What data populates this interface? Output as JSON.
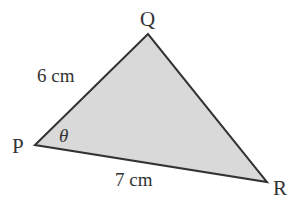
{
  "diagram": {
    "type": "triangle",
    "fill_color": "#d9d9d9",
    "stroke_color": "#333333",
    "vertices": [
      {
        "name": "P",
        "x": 35,
        "y": 145
      },
      {
        "name": "Q",
        "x": 148,
        "y": 34
      },
      {
        "name": "R",
        "x": 267,
        "y": 182
      }
    ],
    "labels": {
      "vertex_p": "P",
      "vertex_q": "Q",
      "vertex_r": "R",
      "side_pq": "6 cm",
      "side_pr": "7 cm",
      "angle_p": "θ"
    }
  }
}
